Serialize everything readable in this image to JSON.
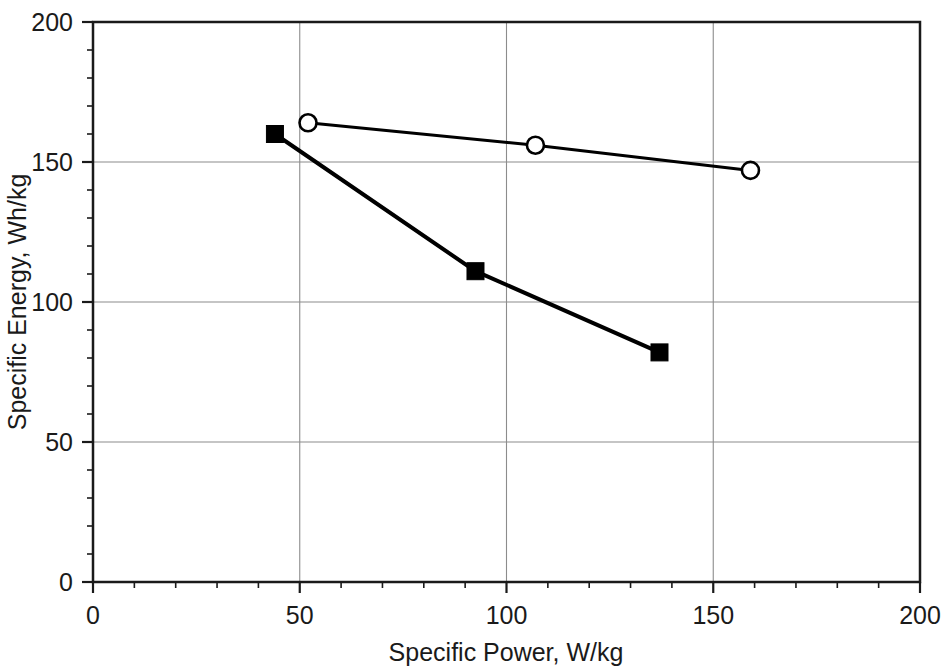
{
  "chart_data": {
    "type": "line",
    "title": "",
    "xlabel": "Specific Power, W/kg",
    "ylabel": "Specific Energy, Wh/kg",
    "xlim": [
      0,
      200
    ],
    "ylim": [
      0,
      200
    ],
    "xticks": [
      0,
      50,
      100,
      150,
      200
    ],
    "yticks": [
      0,
      50,
      100,
      150,
      200
    ],
    "xtick_labels": [
      "0",
      "50",
      "100",
      "150",
      "200"
    ],
    "ytick_labels": [
      "0",
      "50",
      "100",
      "150",
      "200"
    ],
    "x_minor_tick_step": 10,
    "y_minor_tick_step": 10,
    "grid": true,
    "grid_color": "#8c8c8c",
    "legend": null,
    "legend_position": "none",
    "line_color": "#000000",
    "series": [
      {
        "name": "filled-square-series",
        "marker": "filled-square",
        "marker_color": "#000000",
        "line_color": "#000000",
        "line_width": 4,
        "points": [
          {
            "x": 44,
            "y": 160
          },
          {
            "x": 92.5,
            "y": 111
          },
          {
            "x": 137,
            "y": 82
          }
        ]
      },
      {
        "name": "open-circle-series",
        "marker": "open-circle",
        "marker_color": "#ffffff",
        "marker_edge_color": "#000000",
        "line_color": "#000000",
        "line_width": 3,
        "points": [
          {
            "x": 52,
            "y": 164
          },
          {
            "x": 107,
            "y": 156
          },
          {
            "x": 159,
            "y": 147
          }
        ]
      }
    ]
  },
  "axes": {
    "x_title": "Specific Power, W/kg",
    "y_title": "Specific Energy, Wh/kg",
    "x_ticks": [
      "0",
      "50",
      "100",
      "150",
      "200"
    ],
    "y_ticks": [
      "0",
      "50",
      "100",
      "150",
      "200"
    ]
  }
}
